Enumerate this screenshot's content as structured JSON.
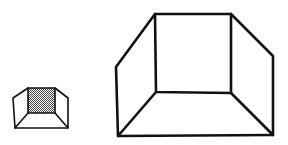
{
  "figure": {
    "colors": {
      "stroke": "#111111",
      "background": "#ffffff",
      "hatch": "#555555"
    },
    "small_box": {
      "back_face_fill": "hatched",
      "back_face": [
        [
          28,
          88
        ],
        [
          55,
          88
        ],
        [
          55,
          113
        ],
        [
          28,
          113
        ]
      ],
      "left_outer_top": [
        13,
        98
      ],
      "left_outer_bottom": [
        15,
        128
      ],
      "right_outer_top": [
        68,
        98
      ],
      "right_outer_bottom": [
        68,
        128
      ]
    },
    "large_box": {
      "back_face_fill": "none",
      "back_face": [
        [
          155,
          14
        ],
        [
          231,
          14
        ],
        [
          231,
          93
        ],
        [
          156,
          92
        ]
      ],
      "left_outer_top": [
        116,
        67
      ],
      "left_outer_bottom": [
        118,
        136
      ],
      "right_outer_top": [
        273,
        56
      ],
      "right_outer_bottom": [
        273,
        135
      ]
    }
  }
}
